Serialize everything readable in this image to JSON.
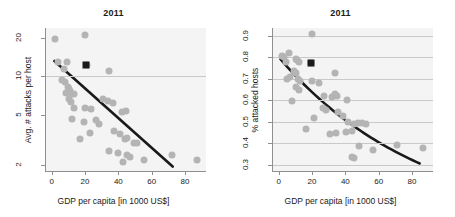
{
  "figure": {
    "background": "#ffffff",
    "point_color": "#b4b4b4",
    "trend_color": "#1a1a1a",
    "grid_color": "#c9c9c9",
    "axis_color": "#8f8f8f"
  },
  "chart_data": [
    {
      "type": "scatter",
      "panel": "left",
      "title": "2011",
      "xlabel": "GDP per capita [in 1000 US$]",
      "ylabel": "Avg. # attacks per host",
      "xlim": [
        -4,
        92
      ],
      "ylim": [
        1.8,
        24
      ],
      "yscale": "log",
      "xscale": "linear",
      "xticks": [
        0,
        20,
        40,
        60,
        80
      ],
      "xticklabels": [
        "0",
        "20",
        "40",
        "60",
        "80"
      ],
      "yticks": [
        2,
        5,
        10,
        20
      ],
      "yticklabels": [
        "2",
        "5",
        "10",
        "20"
      ],
      "grid": "horizontal at y=10",
      "gridlines_y": [
        10
      ],
      "legend": null,
      "points": [
        {
          "x": 1.5,
          "y": 19.5
        },
        {
          "x": 19.5,
          "y": 21.0
        },
        {
          "x": 3.0,
          "y": 13.0
        },
        {
          "x": 8.5,
          "y": 13.0
        },
        {
          "x": 6.5,
          "y": 11.5
        },
        {
          "x": 33.5,
          "y": 11.0
        },
        {
          "x": 20.5,
          "y": 12.3
        },
        {
          "x": 5.5,
          "y": 9.3
        },
        {
          "x": 7.5,
          "y": 9.0
        },
        {
          "x": 9.0,
          "y": 8.3
        },
        {
          "x": 10.0,
          "y": 8.0
        },
        {
          "x": 10.5,
          "y": 7.6
        },
        {
          "x": 8.0,
          "y": 7.4
        },
        {
          "x": 11.5,
          "y": 7.3
        },
        {
          "x": 12.5,
          "y": 7.2
        },
        {
          "x": 9.5,
          "y": 6.6
        },
        {
          "x": 11.0,
          "y": 6.3
        },
        {
          "x": 13.0,
          "y": 5.6
        },
        {
          "x": 19.5,
          "y": 5.6
        },
        {
          "x": 23.0,
          "y": 5.5
        },
        {
          "x": 30.0,
          "y": 6.6
        },
        {
          "x": 33.0,
          "y": 6.4
        },
        {
          "x": 36.0,
          "y": 6.2
        },
        {
          "x": 41.5,
          "y": 5.2
        },
        {
          "x": 44.0,
          "y": 5.3
        },
        {
          "x": 11.5,
          "y": 4.6
        },
        {
          "x": 19.0,
          "y": 4.4
        },
        {
          "x": 26.0,
          "y": 4.5
        },
        {
          "x": 22.5,
          "y": 3.6
        },
        {
          "x": 27.5,
          "y": 4.2
        },
        {
          "x": 36.5,
          "y": 3.7
        },
        {
          "x": 16.5,
          "y": 3.2
        },
        {
          "x": 40.5,
          "y": 3.5
        },
        {
          "x": 43.5,
          "y": 3.2
        },
        {
          "x": 44.5,
          "y": 3.3
        },
        {
          "x": 48.5,
          "y": 3.0
        },
        {
          "x": 50.5,
          "y": 3.0
        },
        {
          "x": 33.5,
          "y": 2.6
        },
        {
          "x": 39.0,
          "y": 2.5
        },
        {
          "x": 44.5,
          "y": 2.4
        },
        {
          "x": 46.5,
          "y": 2.3
        },
        {
          "x": 42.0,
          "y": 2.1
        },
        {
          "x": 55.0,
          "y": 2.2
        },
        {
          "x": 71.5,
          "y": 2.4
        },
        {
          "x": 86.5,
          "y": 2.2
        }
      ],
      "highlight_point": {
        "x": 20.0,
        "y": 12.3,
        "marker": "square",
        "color": "#1a1a1a"
      },
      "trend": {
        "kind": "line",
        "description": "straight declining fit on log-y axis",
        "start": {
          "x": 1.0,
          "y": 13.2
        },
        "end": {
          "x": 72.0,
          "y": 1.95
        }
      }
    },
    {
      "type": "scatter",
      "panel": "right",
      "title": "2011",
      "xlabel": "GDP per capita [in 1000 US$]",
      "ylabel": "% attacked hosts",
      "xlim": [
        -4,
        92
      ],
      "ylim": [
        0.27,
        0.935
      ],
      "yscale": "linear",
      "xscale": "linear",
      "xticks": [
        0,
        20,
        40,
        60,
        80
      ],
      "xticklabels": [
        "0",
        "20",
        "40",
        "60",
        "80"
      ],
      "yticks": [
        0.3,
        0.4,
        0.5,
        0.6,
        0.7,
        0.8,
        0.9
      ],
      "yticklabels": [
        "0.3",
        "0.4",
        "0.5",
        "0.6",
        "0.7",
        "0.8",
        "0.9"
      ],
      "grid": "horizontal at every y tick",
      "gridlines_y": [
        0.3,
        0.4,
        0.5,
        0.6,
        0.7,
        0.8,
        0.9
      ],
      "legend": null,
      "points": [
        {
          "x": 19.5,
          "y": 0.905
        },
        {
          "x": 1.5,
          "y": 0.805
        },
        {
          "x": 2.5,
          "y": 0.8
        },
        {
          "x": 5.5,
          "y": 0.82
        },
        {
          "x": 4.0,
          "y": 0.775
        },
        {
          "x": 9.5,
          "y": 0.79
        },
        {
          "x": 10.5,
          "y": 0.785
        },
        {
          "x": 11.5,
          "y": 0.775
        },
        {
          "x": 19.0,
          "y": 0.772
        },
        {
          "x": 4.5,
          "y": 0.7
        },
        {
          "x": 6.0,
          "y": 0.705
        },
        {
          "x": 8.5,
          "y": 0.735
        },
        {
          "x": 9.5,
          "y": 0.725
        },
        {
          "x": 11.0,
          "y": 0.7
        },
        {
          "x": 12.0,
          "y": 0.69
        },
        {
          "x": 10.0,
          "y": 0.66
        },
        {
          "x": 11.5,
          "y": 0.645
        },
        {
          "x": 19.5,
          "y": 0.69
        },
        {
          "x": 23.5,
          "y": 0.68
        },
        {
          "x": 33.0,
          "y": 0.725
        },
        {
          "x": 7.5,
          "y": 0.595
        },
        {
          "x": 26.5,
          "y": 0.62
        },
        {
          "x": 31.5,
          "y": 0.615
        },
        {
          "x": 33.0,
          "y": 0.63
        },
        {
          "x": 34.5,
          "y": 0.62
        },
        {
          "x": 40.5,
          "y": 0.6
        },
        {
          "x": 26.0,
          "y": 0.565
        },
        {
          "x": 28.0,
          "y": 0.555
        },
        {
          "x": 35.0,
          "y": 0.545
        },
        {
          "x": 38.0,
          "y": 0.525
        },
        {
          "x": 20.5,
          "y": 0.515
        },
        {
          "x": 41.0,
          "y": 0.5
        },
        {
          "x": 44.5,
          "y": 0.49
        },
        {
          "x": 47.0,
          "y": 0.495
        },
        {
          "x": 49.5,
          "y": 0.495
        },
        {
          "x": 51.5,
          "y": 0.49
        },
        {
          "x": 15.5,
          "y": 0.465
        },
        {
          "x": 30.0,
          "y": 0.44
        },
        {
          "x": 34.0,
          "y": 0.445
        },
        {
          "x": 39.5,
          "y": 0.45
        },
        {
          "x": 43.5,
          "y": 0.455
        },
        {
          "x": 47.5,
          "y": 0.385
        },
        {
          "x": 56.0,
          "y": 0.37
        },
        {
          "x": 70.5,
          "y": 0.39
        },
        {
          "x": 86.0,
          "y": 0.375
        },
        {
          "x": 43.5,
          "y": 0.335
        },
        {
          "x": 44.5,
          "y": 0.33
        }
      ],
      "highlight_point": {
        "x": 19.0,
        "y": 0.772,
        "marker": "square",
        "color": "#1a1a1a"
      },
      "trend": {
        "kind": "curve",
        "description": "convex decaying exponential fit",
        "start": {
          "x": 0.5,
          "y": 0.79
        },
        "end": {
          "x": 84.0,
          "y": 0.305
        }
      }
    }
  ]
}
